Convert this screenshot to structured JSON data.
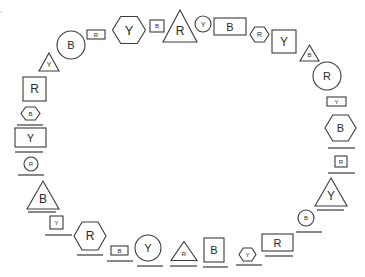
{
  "diagram": {
    "stroke_color": "#3a3a3a",
    "background": "#ffffff",
    "shapes": [
      {
        "type": "triangle",
        "label": "Y",
        "cx": 49,
        "cy": 62,
        "w": 20,
        "h": 18,
        "fs": 7
      },
      {
        "type": "circle",
        "label": "B",
        "cx": 71,
        "cy": 45,
        "r": 14,
        "fs": 11
      },
      {
        "type": "rect",
        "label": "R",
        "cx": 96,
        "cy": 34.5,
        "w": 18,
        "h": 9,
        "fs": 6
      },
      {
        "type": "hexagon",
        "label": "Y",
        "cx": 129,
        "cy": 30,
        "w": 33,
        "h": 27,
        "fs": 13
      },
      {
        "type": "rect",
        "label": "B",
        "cx": 157,
        "cy": 26,
        "w": 14,
        "h": 12,
        "fs": 6
      },
      {
        "type": "triangle",
        "label": "R",
        "cx": 180,
        "cy": 26,
        "w": 34,
        "h": 32,
        "fs": 12
      },
      {
        "type": "circle",
        "label": "Y",
        "cx": 203,
        "cy": 24,
        "r": 8,
        "fs": 7
      },
      {
        "type": "rect",
        "label": "B",
        "cx": 230,
        "cy": 26.5,
        "w": 32,
        "h": 17,
        "fs": 11
      },
      {
        "type": "hexagon",
        "label": "R",
        "cx": 259.5,
        "cy": 34.5,
        "w": 19,
        "h": 15,
        "fs": 7
      },
      {
        "type": "rect",
        "label": "Y",
        "cx": 284,
        "cy": 41.5,
        "w": 24,
        "h": 23,
        "fs": 12
      },
      {
        "type": "triangle",
        "label": "B",
        "cx": 309.5,
        "cy": 53,
        "w": 19,
        "h": 16,
        "fs": 6
      },
      {
        "type": "circle",
        "label": "R",
        "cx": 327,
        "cy": 76,
        "r": 14,
        "fs": 11
      },
      {
        "type": "rect",
        "label": "Y",
        "cx": 336.5,
        "cy": 101.5,
        "w": 19,
        "h": 9,
        "fs": 6
      },
      {
        "type": "hexagon",
        "label": "B",
        "cx": 340.5,
        "cy": 128,
        "w": 31,
        "h": 26,
        "fs": 11,
        "underline": {
          "y": 148,
          "x1": 328,
          "x2": 355
        }
      },
      {
        "type": "rect",
        "label": "R",
        "cx": 341,
        "cy": 161.5,
        "w": 12,
        "h": 11,
        "fs": 6,
        "underline": {
          "y": 173,
          "x1": 328,
          "x2": 355
        }
      },
      {
        "type": "triangle",
        "label": "Y",
        "cx": 331,
        "cy": 192,
        "w": 32,
        "h": 28,
        "fs": 12,
        "underline": {
          "y": 210,
          "x1": 317,
          "x2": 344
        }
      },
      {
        "type": "circle",
        "label": "B",
        "cx": 306,
        "cy": 218,
        "r": 8,
        "fs": 6,
        "underline": {
          "y": 232,
          "x1": 296,
          "x2": 322
        }
      },
      {
        "type": "rect",
        "label": "R",
        "cx": 277.5,
        "cy": 242.5,
        "w": 31,
        "h": 17,
        "fs": 11,
        "underline": {
          "y": 256,
          "x1": 265,
          "x2": 293
        }
      },
      {
        "type": "hexagon",
        "label": "Y",
        "cx": 247.5,
        "cy": 254.5,
        "w": 17,
        "h": 13,
        "fs": 6,
        "underline": {
          "y": 265,
          "x1": 236,
          "x2": 262
        }
      },
      {
        "type": "rect",
        "label": "B",
        "cx": 214,
        "cy": 250,
        "w": 20,
        "h": 24,
        "fs": 11,
        "underline": {
          "y": 267,
          "x1": 203,
          "x2": 228
        }
      },
      {
        "type": "triangle",
        "label": "R",
        "cx": 184,
        "cy": 251,
        "w": 26,
        "h": 19,
        "fs": 6,
        "underline": {
          "y": 266,
          "x1": 170,
          "x2": 197
        }
      },
      {
        "type": "circle",
        "label": "Y",
        "cx": 148,
        "cy": 248,
        "r": 13,
        "fs": 11,
        "underline": {
          "y": 266,
          "x1": 137,
          "x2": 163
        }
      },
      {
        "type": "rect",
        "label": "B",
        "cx": 119.5,
        "cy": 250.5,
        "w": 17,
        "h": 9,
        "fs": 6,
        "underline": {
          "y": 261,
          "x1": 107,
          "x2": 133
        }
      },
      {
        "type": "hexagon",
        "label": "R",
        "cx": 90,
        "cy": 236,
        "w": 32,
        "h": 28,
        "fs": 12,
        "underline": {
          "y": 255,
          "x1": 77,
          "x2": 103
        }
      },
      {
        "type": "rect",
        "label": "Y",
        "cx": 56.5,
        "cy": 222.5,
        "w": 13,
        "h": 13,
        "fs": 6,
        "underline": {
          "y": 235,
          "x1": 45,
          "x2": 72
        }
      },
      {
        "type": "triangle",
        "label": "B",
        "cx": 43,
        "cy": 195,
        "w": 32,
        "h": 28,
        "fs": 12,
        "underline": {
          "y": 212,
          "x1": 28,
          "x2": 56
        }
      },
      {
        "type": "circle",
        "label": "R",
        "cx": 31,
        "cy": 164,
        "r": 7,
        "fs": 6,
        "underline": {
          "y": 175,
          "x1": 18,
          "x2": 44
        }
      },
      {
        "type": "rect",
        "label": "Y",
        "cx": 30.5,
        "cy": 137.5,
        "w": 31,
        "h": 19,
        "fs": 11,
        "underline": {
          "y": 152,
          "x1": 15,
          "x2": 43
        }
      },
      {
        "type": "hexagon",
        "label": "B",
        "cx": 30.5,
        "cy": 113.5,
        "w": 19,
        "h": 13,
        "fs": 6,
        "underline": {
          "y": 125,
          "x1": 17,
          "x2": 43
        }
      },
      {
        "type": "rect",
        "label": "R",
        "cx": 34.5,
        "cy": 89,
        "w": 23,
        "h": 24,
        "fs": 12
      }
    ]
  }
}
